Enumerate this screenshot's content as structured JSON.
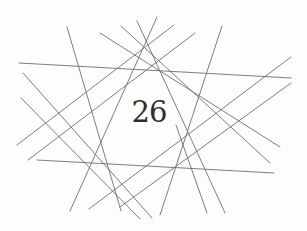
{
  "figure": {
    "type": "line-arrangement",
    "page_number": "26",
    "stroke_color": "#6e6e6e",
    "text_color": "#2e2e2e",
    "background_color": "#fdfdfd",
    "lines": [
      {
        "x1": 19,
        "y1": 63,
        "x2": 291,
        "y2": 78
      },
      {
        "x1": 37,
        "y1": 160,
        "x2": 274,
        "y2": 173
      },
      {
        "x1": 23,
        "y1": 73,
        "x2": 152,
        "y2": 218
      },
      {
        "x1": 21,
        "y1": 98,
        "x2": 140,
        "y2": 219
      },
      {
        "x1": 67,
        "y1": 27,
        "x2": 121,
        "y2": 211
      },
      {
        "x1": 100,
        "y1": 33,
        "x2": 280,
        "y2": 147
      },
      {
        "x1": 121,
        "y1": 26,
        "x2": 270,
        "y2": 163
      },
      {
        "x1": 137,
        "y1": 21,
        "x2": 225,
        "y2": 213
      },
      {
        "x1": 157,
        "y1": 17,
        "x2": 70,
        "y2": 211
      },
      {
        "x1": 174,
        "y1": 25,
        "x2": 17,
        "y2": 145
      },
      {
        "x1": 195,
        "y1": 33,
        "x2": 28,
        "y2": 160
      },
      {
        "x1": 222,
        "y1": 26,
        "x2": 160,
        "y2": 215
      },
      {
        "x1": 291,
        "y1": 57,
        "x2": 89,
        "y2": 209
      },
      {
        "x1": 291,
        "y1": 83,
        "x2": 120,
        "y2": 207
      },
      {
        "x1": 176,
        "y1": 125,
        "x2": 207,
        "y2": 213
      }
    ]
  }
}
